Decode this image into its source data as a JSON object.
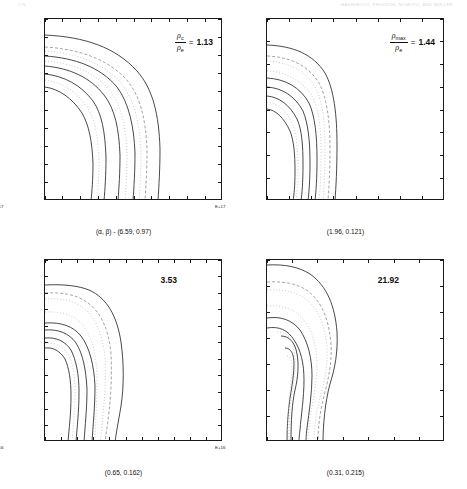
{
  "runhead": {
    "left": "276",
    "right": "HASHIMOTO, ERIGUCHI, NOMOTO, AND MÜLLER"
  },
  "figure": {
    "panels": [
      {
        "id": "panel-top-left",
        "annotation": {
          "kind": "fraction",
          "numerator": "ρ",
          "numerator_sub": "c",
          "denominator": "ρ",
          "denominator_sub": "e",
          "equals": "=",
          "value": "1.13"
        },
        "caption": "(α, β) - (6.59, 0.97)",
        "yticks": [
          "0",
          "1",
          "2",
          "3",
          "4",
          "5",
          "6",
          "7",
          "8",
          "9",
          "10"
        ],
        "xticks": [
          "0.0",
          "1.0",
          "2.0",
          "3.0",
          "4.0",
          "5.0",
          "6.0",
          "7.0",
          "8.0",
          "9.0",
          "10.0"
        ],
        "xexp": "E+17",
        "yexp": "E+17"
      },
      {
        "id": "panel-top-right",
        "annotation": {
          "kind": "fraction",
          "numerator": "ρ",
          "numerator_sub": "max",
          "denominator": "ρ",
          "denominator_sub": "e",
          "equals": "=",
          "value": "1.44"
        },
        "caption": "(1.96, 0.121)",
        "yticks": [
          "0",
          "1",
          "2",
          "3",
          "4",
          "5",
          "6",
          "7",
          "8"
        ],
        "xticks": [
          "0.0",
          "1.0",
          "2.0",
          "3.0",
          "4.0",
          "5.0",
          "6.0",
          "7.0",
          "8.0"
        ],
        "xexp": "E+17",
        "yexp": "E+17"
      },
      {
        "id": "panel-bottom-left",
        "annotation": {
          "kind": "plain",
          "value": "3.53"
        },
        "caption": "(0.65, 0.162)",
        "yticks": [
          "0",
          "5",
          "10",
          "15",
          "20",
          "25",
          "30",
          "35",
          "40",
          "45",
          "50",
          "55"
        ],
        "xticks": [
          "0.0",
          "5.0",
          "10.0",
          "15.0",
          "20.0",
          "25.0",
          "30.0",
          "35.0",
          "40.0",
          "45.0",
          "50.0",
          "55.0"
        ],
        "xexp": "E+16",
        "yexp": "E+16"
      },
      {
        "id": "panel-bottom-right",
        "annotation": {
          "kind": "plain",
          "value": "21.92"
        },
        "caption": "(0.31, 0.215)",
        "yticks": [
          "0",
          "5",
          "10",
          "15",
          "20",
          "25",
          "30",
          "35"
        ],
        "xticks": [
          "0.0",
          "5.0",
          "10.0",
          "15.0",
          "20.0",
          "25.0",
          "30.0",
          "35.0"
        ],
        "xexp": "E+16",
        "yexp": "E+16"
      }
    ]
  },
  "chart_data": {
    "type": "contour-grid",
    "panel_count": 4,
    "grid": "2x2",
    "axis_units": "cm",
    "panels": [
      {
        "name": "panel-top-left",
        "type": "contour",
        "label": "(α, β) - (6.59, 0.97)",
        "alpha": 6.59,
        "beta": 0.97,
        "ratio_label": "ρ_c/ρ_e",
        "ratio_value": 1.13,
        "xlim": [
          0,
          10
        ],
        "ylim": [
          0,
          10
        ],
        "x_exponent": "E+17",
        "y_exponent": "E+17",
        "xticks": [
          0,
          1,
          2,
          3,
          4,
          5,
          6,
          7,
          8,
          9,
          10
        ],
        "yticks": [
          0,
          1,
          2,
          3,
          4,
          5,
          6,
          7,
          8,
          9,
          10
        ],
        "grid": false,
        "legend": "none",
        "contour_levels": [
          0.1,
          0.2,
          0.3,
          0.4,
          0.5,
          0.6,
          0.7,
          0.8,
          0.9
        ],
        "contours": [
          {
            "level": 0.1,
            "style": "solid",
            "y_intercept": 9.1,
            "x_intercept": 7.4
          },
          {
            "level": 0.2,
            "style": "dashed",
            "y_intercept": 8.4,
            "x_intercept": 6.6
          },
          {
            "level": 0.3,
            "style": "dotted",
            "y_intercept": 8.0,
            "x_intercept": 5.5
          },
          {
            "level": 0.4,
            "style": "solid",
            "y_intercept": 7.0,
            "x_intercept": 4.4
          },
          {
            "level": 0.5,
            "style": "solid",
            "y_intercept": 6.5,
            "x_intercept": 3.7
          },
          {
            "level": 0.6,
            "style": "solid",
            "y_intercept": 5.8,
            "x_intercept": 3.1
          },
          {
            "level": 0.7,
            "style": "solid",
            "y_intercept": 5.0,
            "x_intercept": 2.3
          }
        ]
      },
      {
        "name": "panel-top-right",
        "type": "contour",
        "label": "(1.96, 0.121)",
        "alpha": 1.96,
        "beta": 0.121,
        "ratio_label": "ρ_max/ρ_e",
        "ratio_value": 1.44,
        "xlim": [
          0,
          8
        ],
        "ylim": [
          0,
          8
        ],
        "x_exponent": "E+17",
        "y_exponent": "E+17",
        "xticks": [
          0,
          1,
          2,
          3,
          4,
          5,
          6,
          7,
          8
        ],
        "yticks": [
          0,
          1,
          2,
          3,
          4,
          5,
          6,
          7,
          8
        ],
        "grid": false,
        "legend": "none",
        "contour_levels": [
          0.1,
          0.2,
          0.3,
          0.4,
          0.5,
          0.6,
          0.7
        ],
        "contours": [
          {
            "level": 0.1,
            "style": "solid",
            "y_intercept": 6.9,
            "x_intercept": 3.3
          },
          {
            "level": 0.2,
            "style": "dashed",
            "y_intercept": 6.4,
            "x_intercept": 2.7
          },
          {
            "level": 0.3,
            "style": "dotted",
            "y_intercept": 6.2,
            "x_intercept": 2.3
          },
          {
            "level": 0.4,
            "style": "solid",
            "y_intercept": 5.4,
            "x_intercept": 1.7
          },
          {
            "level": 0.5,
            "style": "solid",
            "y_intercept": 5.0,
            "x_intercept": 1.4
          },
          {
            "level": 0.6,
            "style": "solid",
            "y_intercept": 4.6,
            "x_intercept": 1.1
          },
          {
            "level": 0.7,
            "style": "solid",
            "y_intercept": 4.0,
            "x_intercept": 0.8
          }
        ]
      },
      {
        "name": "panel-bottom-left",
        "type": "contour",
        "label": "(0.65, 0.162)",
        "alpha": 0.65,
        "beta": 0.162,
        "ratio_label": "ρ_max/ρ_e",
        "ratio_value": 3.53,
        "xlim": [
          0,
          55
        ],
        "ylim": [
          0,
          55
        ],
        "x_exponent": "E+16",
        "y_exponent": "E+16",
        "xticks": [
          0,
          5,
          10,
          15,
          20,
          25,
          30,
          35,
          40,
          45,
          50,
          55
        ],
        "yticks": [
          0,
          5,
          10,
          15,
          20,
          25,
          30,
          35,
          40,
          45,
          50,
          55
        ],
        "grid": false,
        "legend": "none",
        "contour_levels": [
          0.1,
          0.2,
          0.3,
          0.4,
          0.5,
          0.6,
          0.7
        ],
        "contours": [
          {
            "level": 0.1,
            "style": "solid",
            "y_intercept": 47.5,
            "x_intercept": 23.0
          },
          {
            "level": 0.2,
            "style": "dashed",
            "y_intercept": 45.0,
            "x_intercept": 19.0
          },
          {
            "level": 0.3,
            "style": "dotted",
            "y_intercept": 43.0,
            "x_intercept": 16.0
          },
          {
            "level": 0.4,
            "style": "solid",
            "y_intercept": 36.5,
            "x_intercept": 12.5
          },
          {
            "level": 0.5,
            "style": "solid",
            "y_intercept": 34.5,
            "x_intercept": 10.0
          },
          {
            "level": 0.6,
            "style": "solid",
            "y_intercept": 32.0,
            "x_intercept": 7.5
          },
          {
            "level": 0.7,
            "style": "solid",
            "y_intercept": 29.0,
            "x_intercept": 5.0
          }
        ]
      },
      {
        "name": "panel-bottom-right",
        "type": "contour",
        "label": "(0.31, 0.215)",
        "alpha": 0.31,
        "beta": 0.215,
        "ratio_label": "ρ_max/ρ_e",
        "ratio_value": 21.92,
        "xlim": [
          0,
          35
        ],
        "ylim": [
          0,
          35
        ],
        "x_exponent": "E+16",
        "y_exponent": "E+16",
        "xticks": [
          0,
          5,
          10,
          15,
          20,
          25,
          30,
          35
        ],
        "yticks": [
          0,
          5,
          10,
          15,
          20,
          25,
          30,
          35
        ],
        "grid": false,
        "legend": "none",
        "note": "innermost contours form closed loops (off-center density maximum, toroidal structure)",
        "contour_levels": [
          0.1,
          0.2,
          0.3,
          0.4,
          0.5,
          0.6,
          0.7,
          0.8
        ],
        "contours": [
          {
            "level": 0.1,
            "style": "solid",
            "y_intercept": 34.5,
            "x_intercept": 13.0
          },
          {
            "level": 0.2,
            "style": "dashed",
            "y_intercept": 31.0,
            "x_intercept": 10.5
          },
          {
            "level": 0.3,
            "style": "dotted",
            "y_intercept": 28.0,
            "x_intercept": 8.5
          },
          {
            "level": 0.4,
            "style": "solid",
            "y_intercept": 24.0,
            "x_intercept": 6.0
          },
          {
            "level": 0.5,
            "style": "solid",
            "y_intercept": 22.0,
            "x_intercept": 4.5
          },
          {
            "level": 0.6,
            "style": "closed-loop",
            "center": [
              2.5,
              16.0
            ]
          },
          {
            "level": 0.7,
            "style": "closed-loop",
            "center": [
              2.2,
              16.0
            ]
          },
          {
            "level": 0.8,
            "style": "closed-loop",
            "center": [
              2.0,
              16.0
            ]
          }
        ]
      }
    ]
  }
}
